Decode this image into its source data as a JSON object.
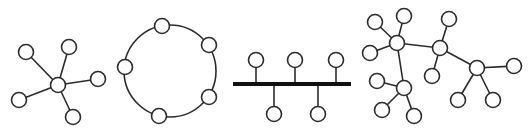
{
  "colors": {
    "stroke": "#2b2b2b",
    "bus": "#111111",
    "node_fill": "#ffffff",
    "background": "#ffffff"
  },
  "node_radius": 7.5,
  "diagrams": [
    {
      "id": "star",
      "name": "Star topology",
      "nodes": [
        {
          "id": "hub",
          "x": 58,
          "y": 85
        },
        {
          "id": "n1",
          "x": 26,
          "y": 52
        },
        {
          "id": "n2",
          "x": 69,
          "y": 47
        },
        {
          "id": "n3",
          "x": 98,
          "y": 79
        },
        {
          "id": "n4",
          "x": 19,
          "y": 100
        },
        {
          "id": "n5",
          "x": 73,
          "y": 117
        }
      ],
      "edges": [
        [
          "hub",
          "n1"
        ],
        [
          "hub",
          "n2"
        ],
        [
          "hub",
          "n3"
        ],
        [
          "hub",
          "n4"
        ],
        [
          "hub",
          "n5"
        ]
      ]
    },
    {
      "id": "ring",
      "name": "Ring topology",
      "ring": {
        "cx": 170,
        "cy": 71,
        "r": 46
      },
      "nodes": [
        {
          "id": "r1",
          "x": 162,
          "y": 26
        },
        {
          "id": "r2",
          "x": 209,
          "y": 45
        },
        {
          "id": "r3",
          "x": 209,
          "y": 97
        },
        {
          "id": "r4",
          "x": 159,
          "y": 116
        },
        {
          "id": "r5",
          "x": 125,
          "y": 67
        }
      ],
      "edges": []
    },
    {
      "id": "bus",
      "name": "Bus topology",
      "bus": {
        "x1": 233,
        "x2": 351,
        "y": 84
      },
      "nodes": [
        {
          "id": "b1",
          "x": 256,
          "y": 60,
          "side": "top"
        },
        {
          "id": "b2",
          "x": 295,
          "y": 60,
          "side": "top"
        },
        {
          "id": "b3",
          "x": 336,
          "y": 60,
          "side": "top"
        },
        {
          "id": "b4",
          "x": 274,
          "y": 114,
          "side": "bottom"
        },
        {
          "id": "b5",
          "x": 318,
          "y": 114,
          "side": "bottom"
        }
      ],
      "edges": []
    },
    {
      "id": "tree",
      "name": "Tree / mesh topology",
      "nodes": [
        {
          "id": "A",
          "x": 397,
          "y": 43
        },
        {
          "id": "a1",
          "x": 375,
          "y": 22
        },
        {
          "id": "a2",
          "x": 404,
          "y": 16
        },
        {
          "id": "a3",
          "x": 370,
          "y": 53
        },
        {
          "id": "B",
          "x": 440,
          "y": 48
        },
        {
          "id": "b1",
          "x": 449,
          "y": 19
        },
        {
          "id": "b2",
          "x": 432,
          "y": 76
        },
        {
          "id": "C",
          "x": 477,
          "y": 68
        },
        {
          "id": "c1",
          "x": 514,
          "y": 66
        },
        {
          "id": "c2",
          "x": 458,
          "y": 100
        },
        {
          "id": "c3",
          "x": 493,
          "y": 100
        },
        {
          "id": "D",
          "x": 404,
          "y": 88
        },
        {
          "id": "d1",
          "x": 377,
          "y": 81
        },
        {
          "id": "d2",
          "x": 382,
          "y": 110
        },
        {
          "id": "d3",
          "x": 414,
          "y": 116
        }
      ],
      "edges": [
        [
          "A",
          "a1"
        ],
        [
          "A",
          "a2"
        ],
        [
          "A",
          "a3"
        ],
        [
          "A",
          "B"
        ],
        [
          "A",
          "D"
        ],
        [
          "B",
          "b1"
        ],
        [
          "B",
          "b2"
        ],
        [
          "B",
          "C"
        ],
        [
          "C",
          "c1"
        ],
        [
          "C",
          "c2"
        ],
        [
          "C",
          "c3"
        ],
        [
          "D",
          "d1"
        ],
        [
          "D",
          "d2"
        ],
        [
          "D",
          "d3"
        ]
      ]
    }
  ]
}
